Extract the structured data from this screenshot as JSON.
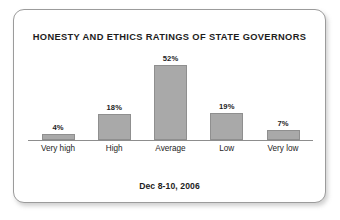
{
  "card": {
    "border_color": "#9b9b9b",
    "background": "#ffffff"
  },
  "chart_data": {
    "type": "bar",
    "title": "HONESTY AND ETHICS RATINGS OF STATE GOVERNORS",
    "footer": "Dec 8-10, 2006",
    "xlabel": "",
    "ylabel": "",
    "ylim": [
      0,
      60
    ],
    "grid": false,
    "legend": false,
    "categories": [
      "Very high",
      "High",
      "Average",
      "Low",
      "Very low"
    ],
    "values": [
      4,
      18,
      52,
      19,
      7
    ],
    "value_labels": [
      "4%",
      "18%",
      "52%",
      "19%",
      "7%"
    ],
    "bar_color": "#a9a9a9",
    "bar_border_color": "#8f8f8f",
    "axis_color": "#8d8d8d"
  }
}
